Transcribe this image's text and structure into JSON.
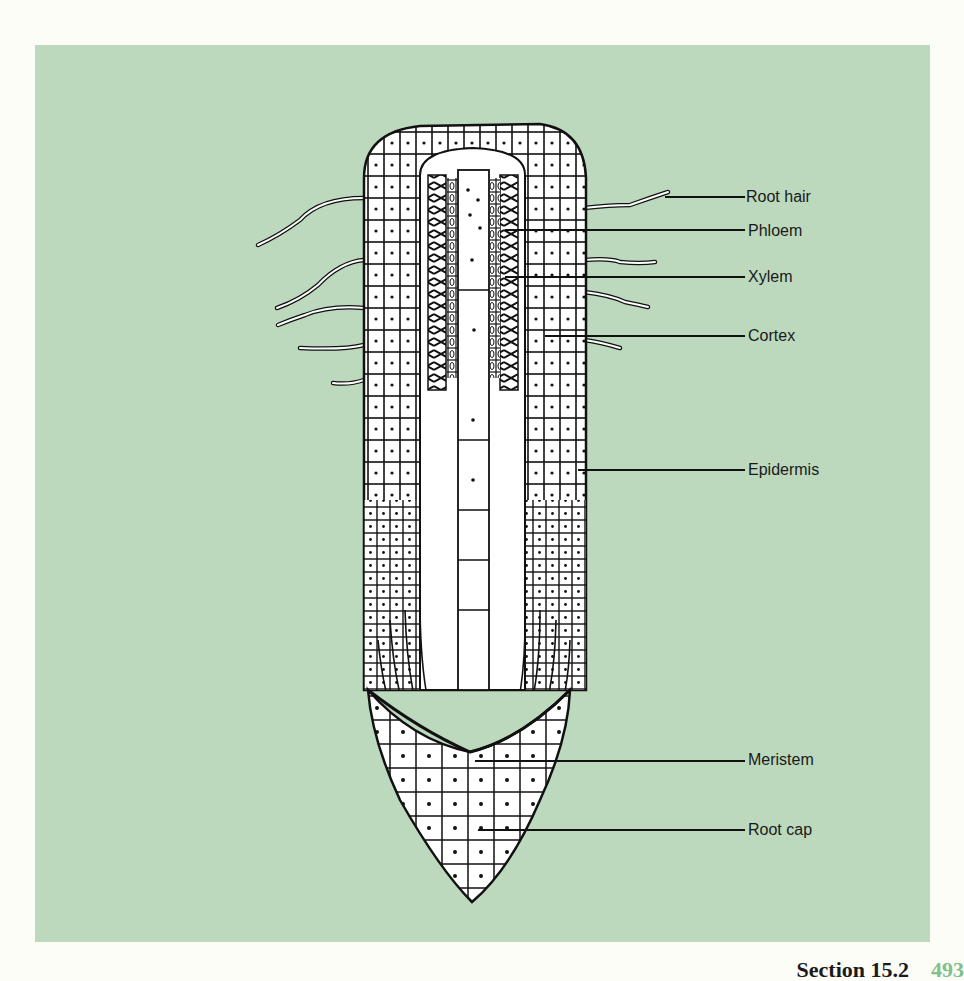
{
  "figure": {
    "background_color": "#bcd9bd",
    "labels": [
      {
        "id": "root-hair",
        "text": "Root hair"
      },
      {
        "id": "phloem",
        "text": "Phloem"
      },
      {
        "id": "xylem",
        "text": "Xylem"
      },
      {
        "id": "cortex",
        "text": "Cortex"
      },
      {
        "id": "epidermis",
        "text": "Epidermis"
      },
      {
        "id": "meristem",
        "text": "Meristem"
      },
      {
        "id": "root-cap",
        "text": "Root cap"
      }
    ]
  },
  "footer": {
    "section": "Section 15.2",
    "page": "493"
  }
}
